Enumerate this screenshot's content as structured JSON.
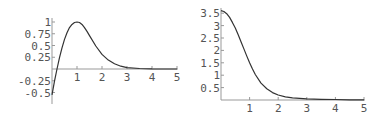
{
  "chart_data": [
    {
      "type": "line",
      "title": "",
      "xlabel": "",
      "ylabel": "",
      "xlim": [
        0,
        5
      ],
      "ylim": [
        -0.55,
        1.0
      ],
      "grid": false,
      "legend": null,
      "x_ticks": [
        "1",
        "2",
        "3",
        "4",
        "5"
      ],
      "y_ticks": [
        "1",
        "0.75",
        "0.5",
        "0.25",
        "-0.25",
        "-0.5"
      ],
      "series": [
        {
          "name": "curve",
          "x": [
            0,
            0.1,
            0.2,
            0.3,
            0.4,
            0.5,
            0.6,
            0.7,
            0.8,
            0.9,
            1.0,
            1.1,
            1.2,
            1.3,
            1.4,
            1.5,
            1.75,
            2.0,
            2.25,
            2.5,
            2.75,
            3.0,
            3.5,
            4.0,
            4.5,
            5.0
          ],
          "values": [
            -0.55,
            -0.26,
            0.0,
            0.24,
            0.45,
            0.63,
            0.77,
            0.88,
            0.95,
            0.99,
            1.0,
            0.99,
            0.95,
            0.88,
            0.8,
            0.71,
            0.49,
            0.31,
            0.19,
            0.11,
            0.06,
            0.03,
            0.01,
            0.003,
            0.001,
            0.0
          ]
        }
      ]
    },
    {
      "type": "line",
      "title": "",
      "xlabel": "",
      "ylabel": "",
      "xlim": [
        0,
        5
      ],
      "ylim": [
        0,
        3.6
      ],
      "grid": false,
      "legend": null,
      "x_ticks": [
        "1",
        "2",
        "3",
        "4",
        "5"
      ],
      "y_ticks": [
        "3.5",
        "3",
        "2.5",
        "2",
        "1.5",
        "1",
        "0.5"
      ],
      "series": [
        {
          "name": "curve",
          "x": [
            0,
            0.1,
            0.2,
            0.3,
            0.4,
            0.5,
            0.6,
            0.7,
            0.8,
            0.9,
            1.0,
            1.1,
            1.2,
            1.4,
            1.6,
            1.8,
            2.0,
            2.25,
            2.5,
            3.0,
            3.5,
            4.0,
            4.5,
            5.0
          ],
          "values": [
            3.6,
            3.57,
            3.48,
            3.33,
            3.13,
            2.9,
            2.63,
            2.35,
            2.06,
            1.78,
            1.5,
            1.25,
            1.03,
            0.68,
            0.45,
            0.3,
            0.2,
            0.13,
            0.09,
            0.05,
            0.03,
            0.02,
            0.01,
            0.01
          ]
        }
      ]
    }
  ]
}
